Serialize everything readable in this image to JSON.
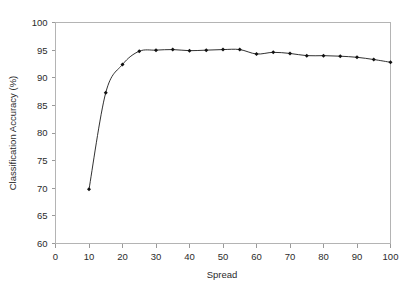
{
  "chart_data": {
    "type": "line",
    "title": "",
    "xlabel": "Spread",
    "ylabel": "Classification Accuracy (%)",
    "xlim": [
      0,
      100
    ],
    "ylim": [
      60,
      100
    ],
    "xticks": [
      0,
      10,
      20,
      30,
      40,
      50,
      60,
      70,
      80,
      90,
      100
    ],
    "xtick_labels": [
      "0",
      "10",
      "20",
      "30",
      "40",
      "50",
      "60",
      "70",
      "80",
      "90",
      "100"
    ],
    "yticks": [
      60,
      65,
      70,
      75,
      80,
      85,
      90,
      95,
      100
    ],
    "ytick_labels": [
      "60",
      "65",
      "70",
      "75",
      "80",
      "85",
      "90",
      "95",
      "100"
    ],
    "grid": false,
    "legend": null,
    "marker": "filled-diamond",
    "line_color": "#1a1a1a",
    "marker_color": "#111111",
    "frame_color": "#b4b4b4",
    "background_color": "#ffffff",
    "x": [
      10,
      15,
      20,
      25,
      30,
      35,
      40,
      45,
      50,
      55,
      60,
      65,
      70,
      75,
      80,
      85,
      90,
      95,
      100
    ],
    "values": [
      69.8,
      87.3,
      92.4,
      94.8,
      95.0,
      95.1,
      94.9,
      95.0,
      95.1,
      95.1,
      94.3,
      94.6,
      94.4,
      94.0,
      94.0,
      93.9,
      93.7,
      93.3,
      92.8
    ],
    "series": [
      {
        "name": "Classification Accuracy",
        "values": [
          69.8,
          87.3,
          92.4,
          94.8,
          95.0,
          95.1,
          94.9,
          95.0,
          95.1,
          95.1,
          94.3,
          94.6,
          94.4,
          94.0,
          94.0,
          93.9,
          93.7,
          93.3,
          92.8
        ]
      }
    ]
  }
}
